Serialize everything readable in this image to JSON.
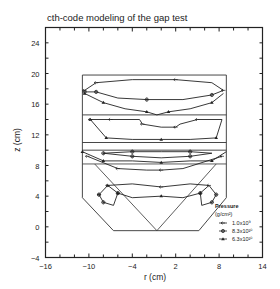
{
  "chart_data": {
    "type": "line",
    "title": "cth-code modeling of the gap test",
    "xlabel": "r  (cm)",
    "ylabel": "z  (cm)",
    "xlim": [
      -16,
      14
    ],
    "ylim": [
      -4,
      26
    ],
    "x_ticks": [
      -16,
      -10,
      -4,
      2,
      8,
      14
    ],
    "y_ticks": [
      -4,
      0,
      4,
      8,
      12,
      16,
      20,
      24
    ],
    "grid": false,
    "legend": {
      "title": "Pressure",
      "units": "(g/cm²)",
      "position": "lower right",
      "entries": [
        {
          "label": "1.0x10⁹",
          "marker": "arrow"
        },
        {
          "label": "8.3x10¹⁰",
          "marker": "cross-circle"
        },
        {
          "label": "6.3x10¹⁰",
          "marker": "triangle"
        }
      ]
    },
    "geometry": {
      "outer_box": {
        "r": [
          -10.9,
          9.0
        ],
        "z": [
          1.2,
          19.8
        ]
      },
      "horizontal_dividers_z": [
        14.6,
        11.0,
        10.0
      ],
      "lower_trapezoid": [
        [
          -10.9,
          8.2
        ],
        [
          -10.9,
          3.8
        ],
        [
          -6.6,
          -0.5
        ],
        [
          5.2,
          -0.5
        ],
        [
          9.0,
          3.8
        ],
        [
          9.0,
          8.2
        ]
      ],
      "cone_apex": [
        -0.6,
        -0.5
      ]
    },
    "series": [
      {
        "name": "1.0x10⁹",
        "region": "upper",
        "points": [
          [
            -10.6,
            17.8
          ],
          [
            -9.0,
            18.8
          ],
          [
            -4,
            19.2
          ],
          [
            2,
            19.2
          ],
          [
            7,
            18.8
          ],
          [
            8.6,
            17.8
          ]
        ]
      },
      {
        "name": "8.3x10¹⁰",
        "region": "upper",
        "points": [
          [
            -10.6,
            17.6
          ],
          [
            -9,
            17.6
          ],
          [
            -6,
            16.8
          ],
          [
            -2,
            16.6
          ],
          [
            3,
            16.6
          ],
          [
            7,
            17.2
          ],
          [
            8.6,
            17.8
          ]
        ]
      },
      {
        "name": "6.3x10¹⁰",
        "region": "upper",
        "points": [
          [
            -10.6,
            17.4
          ],
          [
            -8,
            16.2
          ],
          [
            -5,
            15.4
          ],
          [
            -2,
            15.0
          ],
          [
            -0.6,
            14.6
          ],
          [
            1,
            15.0
          ],
          [
            4,
            15.4
          ],
          [
            7,
            16.2
          ],
          [
            8.6,
            17.4
          ]
        ]
      },
      {
        "name": "1.0x10⁹",
        "region": "middle",
        "points": [
          [
            -9.8,
            14.0
          ],
          [
            -7,
            14.0
          ],
          [
            -3,
            14.0
          ],
          [
            -2.6,
            13.4
          ],
          [
            0,
            13.0
          ],
          [
            2,
            13.0
          ],
          [
            2.6,
            13.4
          ],
          [
            5,
            14.0
          ],
          [
            8.4,
            14.0
          ]
        ]
      },
      {
        "name": "6.3x10¹⁰",
        "region": "middle",
        "points": [
          [
            -9.8,
            14.0
          ],
          [
            -7.6,
            11.6
          ],
          [
            -4,
            11.4
          ],
          [
            0,
            11.4
          ],
          [
            4,
            11.4
          ],
          [
            7.6,
            11.6
          ],
          [
            8.4,
            14.0
          ]
        ]
      },
      {
        "name": "8.3x10¹⁰",
        "region": "lower",
        "points": [
          [
            -8,
            9.6
          ],
          [
            -4,
            9.8
          ],
          [
            0,
            9.8
          ],
          [
            4,
            9.8
          ],
          [
            7,
            9.6
          ],
          [
            4,
            9.2
          ],
          [
            0,
            9.0
          ],
          [
            -4,
            9.2
          ],
          [
            -8,
            9.6
          ]
        ]
      },
      {
        "name": "6.3x10¹⁰",
        "region": "lower",
        "points": [
          [
            -10.9,
            9.8
          ],
          [
            -8,
            8.6
          ],
          [
            -4,
            8.6
          ],
          [
            0,
            8.4
          ],
          [
            4,
            8.6
          ],
          [
            7,
            8.6
          ],
          [
            9.0,
            9.8
          ]
        ]
      },
      {
        "name": "1.0x10⁹",
        "region": "lower",
        "points": [
          [
            -10.2,
            9.2
          ],
          [
            -6,
            7.6
          ],
          [
            -2,
            7.4
          ],
          [
            0,
            7.4
          ],
          [
            3,
            7.6
          ],
          [
            8.4,
            9.2
          ]
        ]
      },
      {
        "name": "1.0x10⁹",
        "region": "bottom",
        "points": [
          [
            -8.6,
            4.2
          ],
          [
            -7.4,
            5.4
          ],
          [
            -4,
            5.6
          ],
          [
            0,
            5.2
          ],
          [
            4,
            5.6
          ],
          [
            6.6,
            5.4
          ],
          [
            7.6,
            4.2
          ]
        ]
      },
      {
        "name": "6.3x10¹⁰",
        "region": "bottom",
        "points": [
          [
            -7.4,
            5.4
          ],
          [
            -6,
            4.4
          ],
          [
            -4,
            3.8
          ],
          [
            0,
            4.0
          ],
          [
            3,
            3.8
          ],
          [
            5.4,
            4.4
          ],
          [
            6.6,
            5.4
          ]
        ]
      },
      {
        "name": "8.3x10¹⁰",
        "region": "bottom",
        "points": [
          [
            -8.6,
            4.2
          ],
          [
            -8.0,
            3.2
          ],
          [
            -6.6,
            2.8
          ],
          [
            -6.0,
            4.4
          ]
        ]
      },
      {
        "name": "8.3x10¹⁰",
        "region": "bottom",
        "points": [
          [
            7.6,
            4.2
          ],
          [
            7.0,
            3.2
          ],
          [
            5.6,
            2.8
          ],
          [
            5.4,
            4.4
          ]
        ]
      }
    ]
  }
}
